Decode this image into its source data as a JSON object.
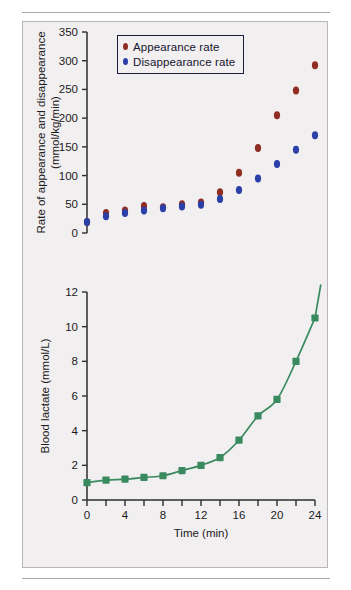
{
  "figure": {
    "background_color": "#f2eff1",
    "border_color": "#b9b5ba",
    "rule_color": "#a9a9ac"
  },
  "legend": {
    "position": "top-left-inside",
    "items": [
      {
        "label": "Appearance rate",
        "color": "#8f2d22",
        "marker": "circle"
      },
      {
        "label": "Disappearance rate",
        "color": "#2b3fa8",
        "marker": "circle"
      }
    ]
  },
  "chart_data": [
    {
      "type": "scatter",
      "title": "",
      "xlabel": "",
      "ylabel": "Rate of appearance and disappearance (mmol/kg/min)",
      "ylabel_line1": "Rate of appearance and disappearance",
      "ylabel_line2": "(mmol/kg/min)",
      "xlim": [
        0,
        24
      ],
      "ylim": [
        0,
        350
      ],
      "xticks": [
        0,
        2,
        4,
        6,
        8,
        10,
        12,
        14,
        16,
        18,
        20,
        22,
        24
      ],
      "xtick_labels_shown": false,
      "yticks": [
        0,
        50,
        100,
        150,
        200,
        250,
        300,
        350
      ],
      "ytick_labels": [
        "0",
        "50",
        "100",
        "150",
        "200",
        "250",
        "300",
        "350"
      ],
      "grid": false,
      "x": [
        0,
        2,
        4,
        6,
        8,
        10,
        12,
        14,
        16,
        18,
        20,
        22,
        24
      ],
      "series": [
        {
          "name": "Appearance rate",
          "color": "#8f2d22",
          "marker": "circle",
          "values": [
            19,
            35,
            39,
            47,
            45,
            50,
            53,
            71,
            105,
            148,
            205,
            248,
            292,
            338
          ]
        },
        {
          "name": "Disappearance rate",
          "color": "#2b3fa8",
          "marker": "circle",
          "values": [
            19,
            29,
            35,
            39,
            43,
            46,
            49,
            59,
            75,
            95,
            120,
            145,
            170,
            209
          ]
        }
      ]
    },
    {
      "type": "scatter",
      "title": "",
      "xlabel": "Time (min)",
      "ylabel": "Blood lactate (mmol/L)",
      "xlim": [
        0,
        24
      ],
      "ylim": [
        0,
        12
      ],
      "xticks": [
        0,
        2,
        4,
        6,
        8,
        10,
        12,
        14,
        16,
        18,
        20,
        22,
        24
      ],
      "xtick_labels": [
        "0",
        "",
        "4",
        "",
        "8",
        "",
        "12",
        "",
        "16",
        "",
        "20",
        "",
        "24"
      ],
      "yticks": [
        0,
        2,
        4,
        6,
        8,
        10,
        12
      ],
      "ytick_labels": [
        "0",
        "2",
        "4",
        "6",
        "8",
        "10",
        "12"
      ],
      "grid": false,
      "x": [
        0,
        2,
        4,
        6,
        8,
        10,
        12,
        14,
        16,
        18,
        20,
        22,
        24
      ],
      "series": [
        {
          "name": "Blood lactate",
          "color": "#3a8a5f",
          "marker": "square",
          "has_fit_curve": true,
          "values": [
            1.0,
            1.15,
            1.2,
            1.3,
            1.4,
            1.7,
            2.0,
            2.45,
            3.45,
            4.85,
            5.8,
            8.0,
            10.5
          ]
        }
      ]
    }
  ]
}
